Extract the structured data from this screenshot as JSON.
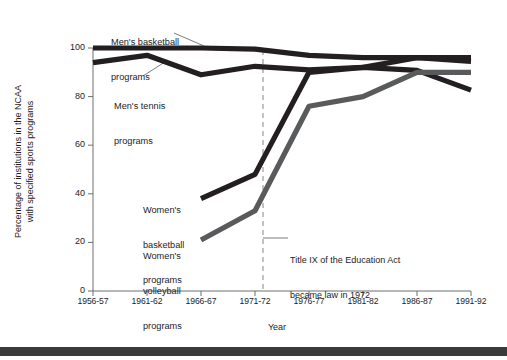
{
  "chart_data": {
    "type": "line",
    "title": "",
    "xlabel": "Year",
    "ylabel": "Percentage of institutions in the NCAA with specified sports programs",
    "ylabel_line1": "Percentage of institutions in the NCAA",
    "ylabel_line2": "with specified sports programs",
    "categories": [
      "1956-57",
      "1961-62",
      "1966-67",
      "1971-72",
      "1976-77",
      "1981-82",
      "1986-87",
      "1991-92"
    ],
    "ylim": [
      0,
      100
    ],
    "yticks": [
      0,
      20,
      40,
      60,
      80,
      100
    ],
    "grid": false,
    "legend": "inline-labels",
    "series": [
      {
        "name": "Men's basketball programs",
        "color": "#231f20",
        "x": [
          "1956-57",
          "1961-62",
          "1966-67",
          "1971-72",
          "1976-77",
          "1981-82",
          "1986-87",
          "1991-92"
        ],
        "values": [
          100,
          100,
          100,
          99.5,
          97,
          96,
          96,
          96
        ]
      },
      {
        "name": "Men's tennis programs",
        "color": "#231f20",
        "x": [
          "1956-57",
          "1961-62",
          "1966-67",
          "1971-72",
          "1976-77",
          "1981-82",
          "1986-87",
          "1991-92"
        ],
        "values": [
          94,
          97,
          89,
          92.5,
          91,
          92,
          90.5,
          82
        ]
      },
      {
        "name": "Women's basketball programs",
        "color": "#231f20",
        "x": [
          "1966-67",
          "1971-72",
          "1976-77",
          "1981-82",
          "1986-87",
          "1991-92"
        ],
        "values": [
          38,
          48,
          90,
          92,
          96,
          94.5
        ]
      },
      {
        "name": "Women's volleyball programs",
        "color": "#595a5c",
        "x": [
          "1966-67",
          "1971-72",
          "1976-77",
          "1981-82",
          "1986-87",
          "1991-92"
        ],
        "values": [
          21,
          33,
          76,
          80,
          90,
          90
        ]
      }
    ],
    "annotations": [
      {
        "name": "title-ix-marker",
        "text_line1": "Title IX of the Education Act",
        "text_line2": "became law in 1972",
        "text": "Title IX of the Education Act became law in 1972",
        "at_x": "1971-72",
        "style": "dashed-vertical-line"
      }
    ],
    "series_labels": [
      {
        "name": "Men's basketball programs",
        "line1": "Men's basketball",
        "line2": "programs"
      },
      {
        "name": "Men's tennis programs",
        "line1": "Men's tennis",
        "line2": "programs"
      },
      {
        "name": "Women's basketball programs",
        "line1": "Women's",
        "line2": "basketball",
        "line3": "programs"
      },
      {
        "name": "Women's volleyball programs",
        "line1": "Women's",
        "line2": "volleyball",
        "line3": "programs"
      }
    ]
  },
  "axis": {
    "y_tick_labels": [
      "100",
      "80",
      "60",
      "40",
      "20",
      "0"
    ],
    "x_tick_labels": [
      "1956-57",
      "1961-62",
      "1966-67",
      "1971-72",
      "1976-77",
      "1981-82",
      "1986-87",
      "1991-92"
    ],
    "x_axis_title": "Year"
  },
  "colors": {
    "series_dark": "#231f20",
    "series_gray": "#595a5c",
    "axis": "#6d6e71",
    "text": "#1d1d1d",
    "footer_bar": "#3a3a3c",
    "background": "#ffffff"
  }
}
